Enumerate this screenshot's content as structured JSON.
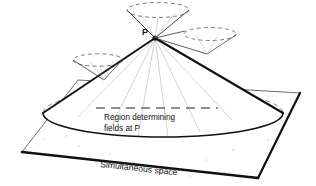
{
  "figure": {
    "background_color": "#ffffff",
    "ink_color": "#111111",
    "width": 316,
    "height": 186
  },
  "labels": {
    "point_p": "P",
    "region_line1": "Region determining",
    "region_line2": "fields at P",
    "plane": "Simultaneous space"
  },
  "elements": {
    "main_cone_name": "past-light-cone",
    "plane_name": "simultaneous-space-plane",
    "apex_name": "apex-point-p",
    "upper_cone_name": "upper-dashed-cone",
    "right_cone_name": "right-dashed-cone",
    "left_cone_name": "left-dashed-cone"
  },
  "geometry": {
    "apex": [
      155,
      38
    ],
    "base_center": [
      163,
      113
    ],
    "base_rx": 120,
    "base_ry": 24,
    "plane_corners": [
      [
        78,
        80
      ],
      [
        300,
        93
      ],
      [
        258,
        178
      ],
      [
        22,
        152
      ]
    ]
  }
}
